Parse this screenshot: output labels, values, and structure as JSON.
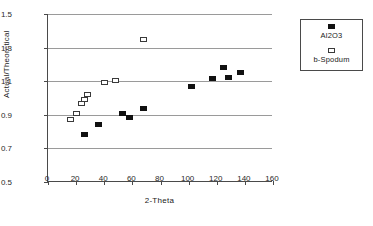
{
  "chart_data": {
    "type": "scatter",
    "title": "",
    "xlabel": "2-Theta",
    "ylabel": "Actual/Theoretical",
    "xlim": [
      0,
      160
    ],
    "ylim": [
      0.5,
      1.5
    ],
    "xticks": [
      0,
      20,
      40,
      60,
      80,
      100,
      120,
      140,
      160
    ],
    "yticks": [
      0.5,
      0.7,
      0.9,
      1.1,
      1.3,
      1.5
    ],
    "xtick_labels": [
      "0",
      "20",
      "40",
      "60",
      "80",
      "100",
      "120",
      "140",
      "160"
    ],
    "ytick_labels": [
      "0.5",
      "0.7",
      "0.9",
      "1.1",
      "1.3",
      "1.5"
    ],
    "grid": "horizontal",
    "legend_position": "right",
    "series": [
      {
        "name": "Al2O3",
        "marker": "filled-square",
        "color": "#111111",
        "points": [
          {
            "x": 26,
            "y": 0.78
          },
          {
            "x": 36,
            "y": 0.84
          },
          {
            "x": 53,
            "y": 0.905
          },
          {
            "x": 58,
            "y": 0.885
          },
          {
            "x": 68,
            "y": 0.935
          },
          {
            "x": 102,
            "y": 1.07
          },
          {
            "x": 117,
            "y": 1.115
          },
          {
            "x": 125,
            "y": 1.18
          },
          {
            "x": 128,
            "y": 1.12
          },
          {
            "x": 137,
            "y": 1.15
          }
        ]
      },
      {
        "name": "b-Spodum",
        "marker": "open-square",
        "color": "#3a3a3a",
        "points": [
          {
            "x": 16,
            "y": 0.87
          },
          {
            "x": 20,
            "y": 0.905
          },
          {
            "x": 24,
            "y": 0.965
          },
          {
            "x": 26,
            "y": 0.99
          },
          {
            "x": 28,
            "y": 1.02
          },
          {
            "x": 40,
            "y": 1.095
          },
          {
            "x": 48,
            "y": 1.105
          },
          {
            "x": 68,
            "y": 1.35
          }
        ]
      }
    ]
  },
  "legend": {
    "entries": [
      {
        "label": "Al2O3",
        "marker": "filled-square"
      },
      {
        "label": "b-Spodum",
        "marker": "open-square"
      }
    ]
  }
}
